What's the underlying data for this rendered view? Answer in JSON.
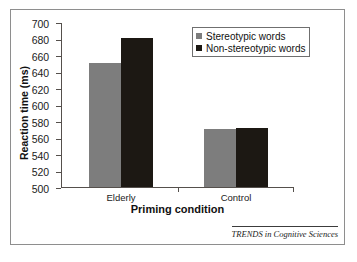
{
  "figure": {
    "attribution": "TRENDS in Cognitive Sciences"
  },
  "colors": {
    "series_stereotypic": "#7d7d7d",
    "series_non_stereotypic": "#1c1813",
    "axis": "#55504c",
    "frame": "#8e8e8e",
    "text": "#111111"
  },
  "chart_data": {
    "type": "bar",
    "title": "",
    "xlabel": "Priming condition",
    "ylabel": "Reaction time (ms)",
    "categories": [
      "Elderly",
      "Control"
    ],
    "series": [
      {
        "name": "Stereotypic words",
        "values": [
          650,
          570
        ]
      },
      {
        "name": "Non-stereotypic words",
        "values": [
          681,
          572
        ]
      }
    ],
    "ylim": [
      500,
      700
    ],
    "ytick_step": 20,
    "yticks": [
      500,
      520,
      540,
      560,
      580,
      600,
      620,
      640,
      660,
      680,
      700
    ],
    "ytick_labels": [
      "500",
      "520",
      "540",
      "560",
      "580",
      "600",
      "620",
      "640",
      "660",
      "680",
      "700"
    ],
    "grid": false,
    "legend_position": "top-right"
  }
}
